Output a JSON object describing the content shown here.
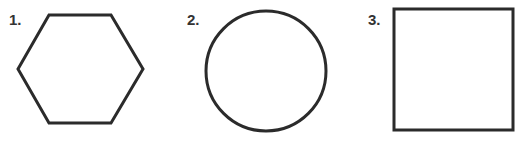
{
  "figures": [
    {
      "label": "1.",
      "shape": "hexagon"
    },
    {
      "label": "2.",
      "shape": "circle"
    },
    {
      "label": "3.",
      "shape": "square"
    }
  ],
  "colors": {
    "stroke": "#2b2b2b",
    "background": "#ffffff"
  }
}
